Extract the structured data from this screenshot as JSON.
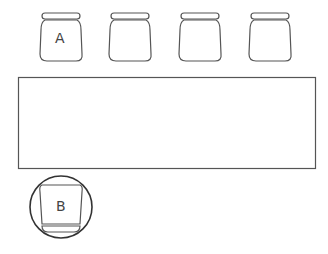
{
  "diagram": {
    "type": "seating-arrangement",
    "table": {
      "shape": "rectangle"
    },
    "chairs": [
      {
        "label": "A",
        "position": "top-1"
      },
      {
        "label": "",
        "position": "top-2"
      },
      {
        "label": "",
        "position": "top-3"
      },
      {
        "label": "",
        "position": "top-4"
      },
      {
        "label": "B",
        "position": "bottom-left",
        "highlighted": true
      }
    ],
    "colors": {
      "stroke": "#444444",
      "background": "#ffffff"
    }
  }
}
